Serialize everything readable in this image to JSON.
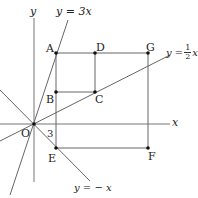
{
  "diagram": {
    "axes": {
      "x_label": "x",
      "y_label": "y",
      "origin_label": "O"
    },
    "lines": [
      {
        "equation": "y=3x",
        "label": "y = 3x"
      },
      {
        "equation": "y=1/2x",
        "label_prefix": "y =",
        "label_num": "1",
        "label_den": "2",
        "label_var": "x"
      },
      {
        "equation": "y=-x",
        "label": "y = − x"
      }
    ],
    "points": {
      "A": "A",
      "B": "B",
      "C": "C",
      "D": "D",
      "E": "E",
      "F": "F",
      "G": "G"
    },
    "annotations": {
      "e_coordinate": "3"
    },
    "colors": {
      "line": "#555555",
      "point": "#111111",
      "text": "#222222"
    }
  }
}
